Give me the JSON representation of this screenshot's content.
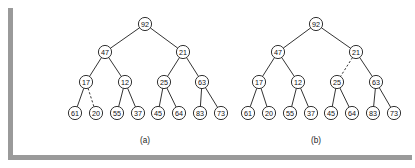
{
  "figure": {
    "background_color": "#ffffff",
    "ink_color": "#1c1c1c",
    "shadow_color": "#9a9a9a",
    "node_radius": 6.6,
    "node_fill": "#ffffff"
  },
  "diagrams": [
    {
      "id": "diagram-a",
      "caption": "(a)",
      "caption_x": 145,
      "caption_y": 140,
      "nodes": [
        {
          "id": "a-92",
          "label": "92",
          "x": 145,
          "y": 24
        },
        {
          "id": "a-47",
          "label": "47",
          "x": 105,
          "y": 52
        },
        {
          "id": "a-21",
          "label": "21",
          "x": 183,
          "y": 52
        },
        {
          "id": "a-17",
          "label": "17",
          "x": 86,
          "y": 82
        },
        {
          "id": "a-12",
          "label": "12",
          "x": 125,
          "y": 82
        },
        {
          "id": "a-25",
          "label": "25",
          "x": 164,
          "y": 82
        },
        {
          "id": "a-63",
          "label": "63",
          "x": 202,
          "y": 82
        },
        {
          "id": "a-61",
          "label": "61",
          "x": 75,
          "y": 113
        },
        {
          "id": "a-20",
          "label": "20",
          "x": 96,
          "y": 113
        },
        {
          "id": "a-55",
          "label": "55",
          "x": 117,
          "y": 113
        },
        {
          "id": "a-37",
          "label": "37",
          "x": 138,
          "y": 113
        },
        {
          "id": "a-45",
          "label": "45",
          "x": 158,
          "y": 113
        },
        {
          "id": "a-64",
          "label": "64",
          "x": 179,
          "y": 113
        },
        {
          "id": "a-83",
          "label": "83",
          "x": 200,
          "y": 113
        },
        {
          "id": "a-73",
          "label": "73",
          "x": 221,
          "y": 113
        }
      ],
      "edges": [
        {
          "from": "a-92",
          "to": "a-47",
          "style": "solid"
        },
        {
          "from": "a-92",
          "to": "a-21",
          "style": "solid"
        },
        {
          "from": "a-47",
          "to": "a-17",
          "style": "solid"
        },
        {
          "from": "a-47",
          "to": "a-12",
          "style": "solid"
        },
        {
          "from": "a-21",
          "to": "a-25",
          "style": "solid"
        },
        {
          "from": "a-21",
          "to": "a-63",
          "style": "solid"
        },
        {
          "from": "a-17",
          "to": "a-61",
          "style": "solid"
        },
        {
          "from": "a-17",
          "to": "a-20",
          "style": "dashed"
        },
        {
          "from": "a-12",
          "to": "a-55",
          "style": "solid"
        },
        {
          "from": "a-12",
          "to": "a-37",
          "style": "solid"
        },
        {
          "from": "a-25",
          "to": "a-45",
          "style": "solid"
        },
        {
          "from": "a-25",
          "to": "a-64",
          "style": "solid"
        },
        {
          "from": "a-63",
          "to": "a-83",
          "style": "solid"
        },
        {
          "from": "a-63",
          "to": "a-73",
          "style": "solid"
        }
      ]
    },
    {
      "id": "diagram-b",
      "caption": "(b)",
      "caption_x": 316,
      "caption_y": 140,
      "nodes": [
        {
          "id": "b-92",
          "label": "92",
          "x": 316,
          "y": 24
        },
        {
          "id": "b-47",
          "label": "47",
          "x": 278,
          "y": 52
        },
        {
          "id": "b-21",
          "label": "21",
          "x": 356,
          "y": 52
        },
        {
          "id": "b-17",
          "label": "17",
          "x": 259,
          "y": 82
        },
        {
          "id": "b-12",
          "label": "12",
          "x": 298,
          "y": 82
        },
        {
          "id": "b-25",
          "label": "25",
          "x": 337,
          "y": 82
        },
        {
          "id": "b-63",
          "label": "63",
          "x": 376,
          "y": 82
        },
        {
          "id": "b-61",
          "label": "61",
          "x": 248,
          "y": 113
        },
        {
          "id": "b-20",
          "label": "20",
          "x": 269,
          "y": 113
        },
        {
          "id": "b-55",
          "label": "55",
          "x": 290,
          "y": 113
        },
        {
          "id": "b-37",
          "label": "37",
          "x": 311,
          "y": 113
        },
        {
          "id": "b-45",
          "label": "45",
          "x": 331,
          "y": 113
        },
        {
          "id": "b-64",
          "label": "64",
          "x": 352,
          "y": 113
        },
        {
          "id": "b-83",
          "label": "83",
          "x": 373,
          "y": 113
        },
        {
          "id": "b-73",
          "label": "73",
          "x": 394,
          "y": 113
        }
      ],
      "edges": [
        {
          "from": "b-92",
          "to": "b-47",
          "style": "solid"
        },
        {
          "from": "b-92",
          "to": "b-21",
          "style": "solid"
        },
        {
          "from": "b-47",
          "to": "b-17",
          "style": "solid"
        },
        {
          "from": "b-47",
          "to": "b-12",
          "style": "solid"
        },
        {
          "from": "b-21",
          "to": "b-25",
          "style": "dashed"
        },
        {
          "from": "b-21",
          "to": "b-63",
          "style": "solid"
        },
        {
          "from": "b-17",
          "to": "b-61",
          "style": "solid"
        },
        {
          "from": "b-17",
          "to": "b-20",
          "style": "solid"
        },
        {
          "from": "b-12",
          "to": "b-55",
          "style": "solid"
        },
        {
          "from": "b-12",
          "to": "b-37",
          "style": "solid"
        },
        {
          "from": "b-25",
          "to": "b-45",
          "style": "solid"
        },
        {
          "from": "b-25",
          "to": "b-64",
          "style": "solid"
        },
        {
          "from": "b-63",
          "to": "b-83",
          "style": "solid"
        },
        {
          "from": "b-63",
          "to": "b-73",
          "style": "solid"
        }
      ]
    }
  ]
}
